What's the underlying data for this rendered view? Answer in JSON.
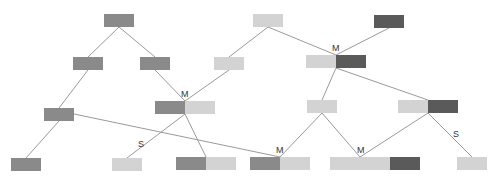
{
  "colors": {
    "mid": "#8a8a8a",
    "light": "#d3d3d3",
    "dark": "#5a5a5a",
    "edge": "#9a9a9a",
    "label": "#333333"
  },
  "boxes": [
    {
      "id": "n1",
      "x": 104,
      "y": 14,
      "cells": [
        "mid"
      ]
    },
    {
      "id": "n2",
      "x": 253,
      "y": 14,
      "cells": [
        "light"
      ]
    },
    {
      "id": "n3",
      "x": 374,
      "y": 15,
      "cells": [
        "dark"
      ]
    },
    {
      "id": "n4",
      "x": 73,
      "y": 57,
      "cells": [
        "mid"
      ]
    },
    {
      "id": "n5",
      "x": 140,
      "y": 57,
      "cells": [
        "mid"
      ]
    },
    {
      "id": "n6",
      "x": 214,
      "y": 57,
      "cells": [
        "light"
      ]
    },
    {
      "id": "n7",
      "x": 306,
      "y": 55,
      "cells": [
        "light",
        "dark"
      ]
    },
    {
      "id": "n8",
      "x": 44,
      "y": 108,
      "cells": [
        "mid"
      ]
    },
    {
      "id": "n9",
      "x": 155,
      "y": 101,
      "cells": [
        "mid",
        "light"
      ]
    },
    {
      "id": "n10",
      "x": 307,
      "y": 100,
      "cells": [
        "light"
      ]
    },
    {
      "id": "n11",
      "x": 398,
      "y": 100,
      "cells": [
        "light",
        "dark"
      ]
    },
    {
      "id": "n12",
      "x": 11,
      "y": 158,
      "cells": [
        "mid"
      ]
    },
    {
      "id": "n13",
      "x": 112,
      "y": 158,
      "cells": [
        "light"
      ]
    },
    {
      "id": "n14",
      "x": 176,
      "y": 157,
      "cells": [
        "mid",
        "light"
      ]
    },
    {
      "id": "n15",
      "x": 250,
      "y": 157,
      "cells": [
        "mid",
        "light"
      ]
    },
    {
      "id": "n16",
      "x": 330,
      "y": 157,
      "cells": [
        "light",
        "light",
        "dark"
      ]
    },
    {
      "id": "n17",
      "x": 457,
      "y": 157,
      "cells": [
        "light"
      ]
    }
  ],
  "edges": [
    [
      119,
      27,
      88,
      57
    ],
    [
      119,
      27,
      155,
      57
    ],
    [
      268,
      27,
      229,
      57
    ],
    [
      268,
      27,
      336,
      55
    ],
    [
      389,
      28,
      336,
      55
    ],
    [
      88,
      70,
      59,
      108
    ],
    [
      155,
      70,
      185,
      101
    ],
    [
      229,
      70,
      185,
      101
    ],
    [
      336,
      68,
      322,
      100
    ],
    [
      336,
      68,
      428,
      100
    ],
    [
      59,
      121,
      26,
      158
    ],
    [
      74,
      114,
      280,
      157
    ],
    [
      185,
      114,
      127,
      158
    ],
    [
      185,
      114,
      206,
      157
    ],
    [
      322,
      113,
      280,
      157
    ],
    [
      322,
      113,
      360,
      157
    ],
    [
      428,
      113,
      360,
      157
    ],
    [
      428,
      113,
      472,
      157
    ]
  ],
  "labels": [
    {
      "text": "M",
      "x": 332,
      "y": 44
    },
    {
      "text": "M",
      "x": 181,
      "y": 90
    },
    {
      "text": "S",
      "x": 138,
      "y": 140
    },
    {
      "text": "M",
      "x": 276,
      "y": 146
    },
    {
      "text": "M",
      "x": 357,
      "y": 146
    },
    {
      "text": "S",
      "x": 453,
      "y": 130
    }
  ]
}
